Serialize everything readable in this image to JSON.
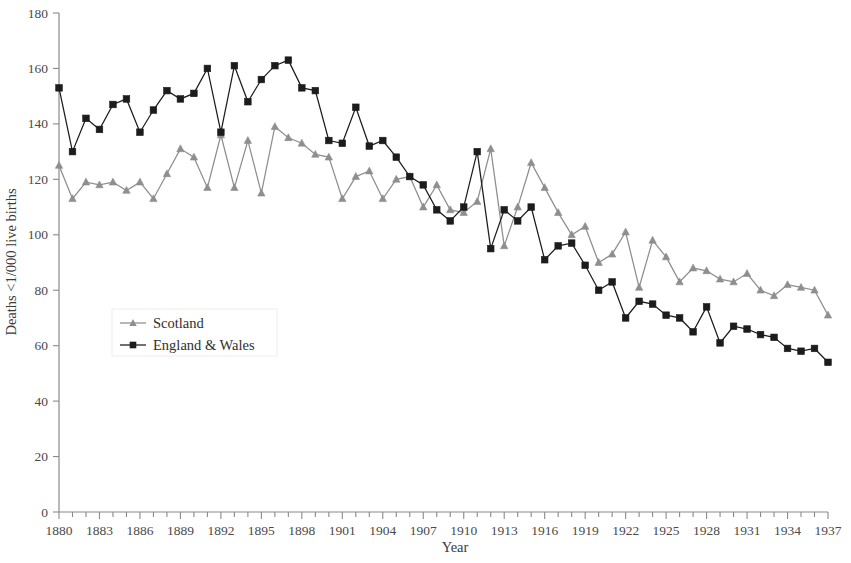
{
  "chart_data": {
    "type": "line",
    "title": "",
    "xlabel": "Year",
    "ylabel": "Deaths <1/000 live births",
    "xlim": [
      1880,
      1937
    ],
    "ylim": [
      0,
      180
    ],
    "yticks": [
      0,
      20,
      40,
      60,
      80,
      100,
      120,
      140,
      160,
      180
    ],
    "xticks": [
      1880,
      1883,
      1886,
      1889,
      1892,
      1895,
      1898,
      1901,
      1904,
      1907,
      1910,
      1913,
      1916,
      1919,
      1922,
      1925,
      1928,
      1931,
      1934,
      1937
    ],
    "x_minor_step": 1,
    "grid": false,
    "legend_position": "center-left",
    "x": [
      1880,
      1881,
      1882,
      1883,
      1884,
      1885,
      1886,
      1887,
      1888,
      1889,
      1890,
      1891,
      1892,
      1893,
      1894,
      1895,
      1896,
      1897,
      1898,
      1899,
      1900,
      1901,
      1902,
      1903,
      1904,
      1905,
      1906,
      1907,
      1908,
      1909,
      1910,
      1911,
      1912,
      1913,
      1914,
      1915,
      1916,
      1917,
      1918,
      1919,
      1920,
      1921,
      1922,
      1923,
      1924,
      1925,
      1926,
      1927,
      1928,
      1929,
      1930,
      1931,
      1932,
      1933,
      1934,
      1935,
      1936,
      1937
    ],
    "series": [
      {
        "name": "Scotland",
        "color": "#8e8e8e",
        "marker": "triangle",
        "values": [
          125,
          113,
          119,
          118,
          119,
          116,
          119,
          113,
          122,
          131,
          128,
          117,
          136,
          117,
          134,
          115,
          139,
          135,
          133,
          129,
          128,
          113,
          121,
          123,
          113,
          120,
          121,
          110,
          118,
          109,
          108,
          112,
          131,
          96,
          110,
          126,
          117,
          108,
          100,
          103,
          90,
          93,
          101,
          81,
          98,
          92,
          83,
          88,
          87,
          84,
          83,
          86,
          80,
          78,
          82,
          81,
          80,
          71
        ]
      },
      {
        "name": "England & Wales",
        "color": "#1c1c1c",
        "marker": "square",
        "values": [
          153,
          130,
          142,
          138,
          147,
          149,
          137,
          145,
          152,
          149,
          151,
          160,
          137,
          161,
          148,
          156,
          161,
          163,
          153,
          152,
          134,
          133,
          146,
          132,
          134,
          128,
          121,
          118,
          109,
          105,
          110,
          130,
          95,
          109,
          105,
          110,
          91,
          96,
          97,
          89,
          80,
          83,
          70,
          76,
          75,
          71,
          70,
          65,
          74,
          61,
          67,
          66,
          64,
          63,
          59,
          58,
          59,
          54
        ]
      }
    ]
  },
  "legend": {
    "items": [
      {
        "label": "Scotland"
      },
      {
        "label": "England & Wales"
      }
    ]
  },
  "colors": {
    "scotland": "#8e8e8e",
    "england_wales": "#1c1c1c",
    "axis": "#8a8a8a",
    "text": "#3a3a3a"
  }
}
